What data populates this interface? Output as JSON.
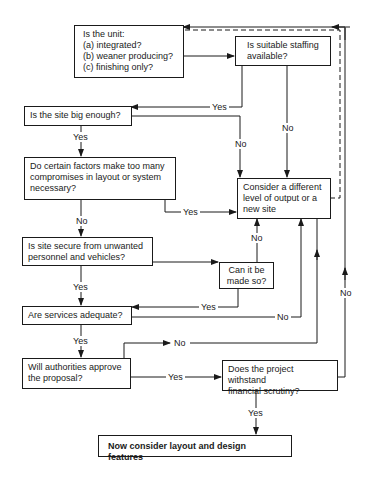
{
  "diagram": {
    "type": "flowchart",
    "nodes": {
      "unit_type": {
        "title": "Is the unit:",
        "options": [
          "(a) integrated?",
          "(b) weaner producing?",
          "(c) finishing only?"
        ]
      },
      "staffing": {
        "lines": [
          "Is suitable staffing",
          "available?"
        ]
      },
      "site_size": {
        "lines": [
          "Is the site big enough?"
        ]
      },
      "factors": {
        "lines": [
          "Do certain factors make too many",
          "compromises in layout or system",
          "necessary?"
        ]
      },
      "consider": {
        "lines": [
          "Consider a different",
          "level of output or a",
          "new site"
        ]
      },
      "secure": {
        "lines": [
          "Is site secure from unwanted",
          "personnel and vehicles?"
        ]
      },
      "made_so": {
        "lines": [
          "Can it be",
          "made so?"
        ]
      },
      "services": {
        "lines": [
          "Are services adequate?"
        ]
      },
      "authorities": {
        "lines": [
          "Will authorities approve",
          "the proposal?"
        ]
      },
      "financial": {
        "lines": [
          "Does the project withstand",
          "financial scrutiny?"
        ]
      },
      "final": {
        "lines": [
          "Now consider layout and design features"
        ]
      }
    },
    "edge_labels": {
      "staffing_yes": "Yes",
      "staffing_no": "No",
      "site_no": "No",
      "site_yes": "Yes",
      "factors_yes": "Yes",
      "factors_no": "No",
      "made_so_no": "No",
      "secure_yes": "Yes",
      "made_so_yes": "Yes",
      "services_no": "No",
      "services_yes": "Yes",
      "authorities_no": "No",
      "authorities_yes": "Yes",
      "financial_no": "No",
      "financial_yes": "Yes"
    }
  }
}
